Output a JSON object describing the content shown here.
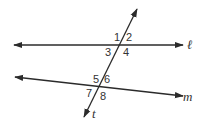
{
  "diagram": {
    "type": "parallel-lines-transversal",
    "lines": [
      {
        "id": "l",
        "label": "ℓ",
        "x1": 14,
        "y1": 45,
        "x2": 183,
        "y2": 45
      },
      {
        "id": "m",
        "label": "m",
        "x1": 15,
        "y1": 77,
        "x2": 183,
        "y2": 96
      },
      {
        "id": "t",
        "label": "t",
        "x1": 84,
        "y1": 117,
        "x2": 137,
        "y2": 9
      }
    ],
    "angles": [
      {
        "label": "1",
        "x": 114,
        "y": 41
      },
      {
        "label": "2",
        "x": 126,
        "y": 41
      },
      {
        "label": "3",
        "x": 105,
        "y": 56
      },
      {
        "label": "4",
        "x": 123,
        "y": 56
      },
      {
        "label": "5",
        "x": 93,
        "y": 83
      },
      {
        "label": "6",
        "x": 104,
        "y": 83
      },
      {
        "label": "7",
        "x": 86,
        "y": 97
      },
      {
        "label": "8",
        "x": 100,
        "y": 100
      }
    ],
    "line_labels": {
      "l": {
        "text": "ℓ",
        "x": 187,
        "y": 49
      },
      "m": {
        "text": "m",
        "x": 183,
        "y": 101
      },
      "t": {
        "text": "t",
        "x": 92,
        "y": 118
      }
    },
    "stroke_color": "#2b2b2b"
  }
}
